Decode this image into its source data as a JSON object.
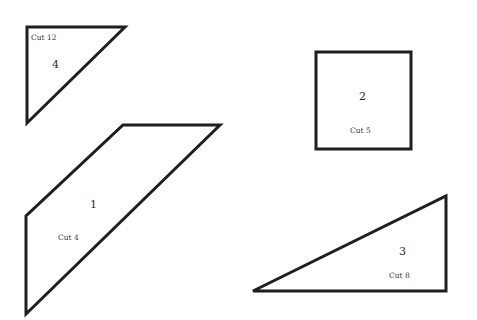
{
  "pieces": [
    {
      "id": "piece-4",
      "shape": "right-triangle",
      "number": "4",
      "cut_label": "Cut 12",
      "points": "27,27 125,27 27,123",
      "number_pos": [
        56,
        68
      ],
      "cut_pos": [
        45,
        40
      ]
    },
    {
      "id": "piece-1",
      "shape": "parallelogram",
      "number": "1",
      "cut_label": "Cut 4",
      "points": "123,125 220,125 26,314 26,216",
      "number_pos": [
        93,
        208
      ],
      "cut_pos": [
        59,
        240
      ]
    },
    {
      "id": "piece-2",
      "shape": "square",
      "number": "2",
      "cut_label": "Cut 5",
      "points": "316,52 411,52 411,149 316,149",
      "number_pos": [
        363,
        100
      ],
      "cut_pos": [
        351,
        133
      ]
    },
    {
      "id": "piece-3",
      "shape": "right-triangle",
      "number": "3",
      "cut_label": "Cut 8",
      "points": "253,291 446,196 446,291",
      "number_pos": [
        403,
        255
      ],
      "cut_pos": [
        392,
        278
      ]
    }
  ],
  "colors": {
    "stroke": "#1f1f1f",
    "background": "#ffffff",
    "text": "#2a2a2a"
  }
}
